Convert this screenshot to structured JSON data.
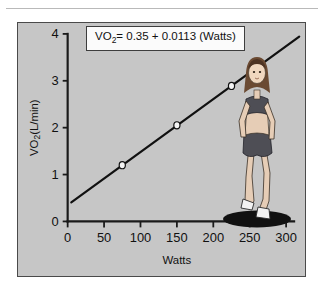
{
  "figure": {
    "panel_background": "#c6c6c6",
    "border_color": "#4a4a4a",
    "equation_label_prefix": "VO",
    "equation_label_sub": "2",
    "equation_label_rest": "= 0.35 + 0.0113 (Watts)",
    "illustration_alt": "female-runner-on-shadow-ellipse"
  },
  "chart_data": {
    "type": "line",
    "title": "",
    "equation": "VO2 = 0.35 + 0.0113 (Watts)",
    "intercept": 0.35,
    "slope": 0.0113,
    "xlabel": "Watts",
    "ylabel": "VO2(L/min)",
    "ylabel_prefix": "VO",
    "ylabel_sub": "2",
    "ylabel_rest": "(L/min)",
    "xlim": [
      0,
      300
    ],
    "ylim": [
      0,
      4
    ],
    "xticks": [
      0,
      50,
      100,
      150,
      200,
      250,
      300
    ],
    "xticklabels": [
      "0",
      "50",
      "100",
      "150",
      "200",
      "250",
      "300"
    ],
    "yticks": [
      0,
      1,
      2,
      3,
      4
    ],
    "yticklabels": [
      "0",
      "1",
      "2",
      "3",
      "4"
    ],
    "grid": false,
    "legend": false,
    "line_color": "#111111",
    "marker_fill": "#f4f4f4",
    "marker_edge": "#111111",
    "line_x_range": [
      5,
      318
    ],
    "series": [
      {
        "name": "VO2 regression",
        "x": [
          75,
          150,
          225
        ],
        "values": [
          1.2,
          2.05,
          2.89
        ]
      }
    ]
  }
}
